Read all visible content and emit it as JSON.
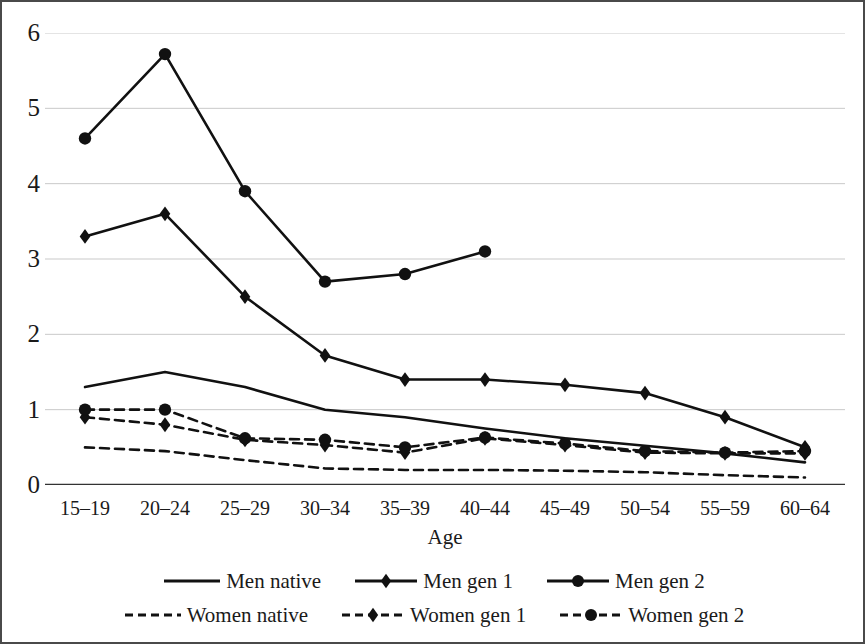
{
  "chart_data": {
    "type": "line",
    "title": "",
    "xlabel": "Age",
    "ylabel": "",
    "categories": [
      "15–19",
      "20–24",
      "25–29",
      "30–34",
      "35–39",
      "40–44",
      "45–49",
      "50–54",
      "55–59",
      "60–64"
    ],
    "ylim": [
      0,
      6
    ],
    "yticks": [
      0,
      1,
      2,
      3,
      4,
      5,
      6
    ],
    "ytick_labels": [
      "0",
      "1",
      "2",
      "3",
      "4",
      "5",
      "6"
    ],
    "grid": "horizontal",
    "legend_position": "bottom",
    "series": [
      {
        "name": "Men native",
        "style": "solid",
        "marker": "none",
        "color": "#111111",
        "values": [
          1.3,
          1.5,
          1.3,
          1.0,
          0.9,
          0.75,
          0.62,
          0.52,
          0.42,
          0.3
        ]
      },
      {
        "name": "Men gen 1",
        "style": "solid",
        "marker": "diamond",
        "color": "#111111",
        "values": [
          3.3,
          3.6,
          2.5,
          1.72,
          1.4,
          1.4,
          1.33,
          1.22,
          0.9,
          0.5
        ]
      },
      {
        "name": "Men gen 2",
        "style": "solid",
        "marker": "circle",
        "color": "#111111",
        "values": [
          4.6,
          5.72,
          3.9,
          2.7,
          2.8,
          3.1,
          null,
          null,
          null,
          null
        ]
      },
      {
        "name": "Women native",
        "style": "dashed",
        "marker": "none",
        "color": "#111111",
        "values": [
          0.5,
          0.45,
          0.33,
          0.22,
          0.2,
          0.2,
          0.19,
          0.17,
          0.13,
          0.1
        ]
      },
      {
        "name": "Women gen 1",
        "style": "dashed",
        "marker": "diamond",
        "color": "#111111",
        "values": [
          0.9,
          0.8,
          0.6,
          0.53,
          0.43,
          0.62,
          0.53,
          0.43,
          0.42,
          0.42
        ]
      },
      {
        "name": "Women gen 2",
        "style": "dashed",
        "marker": "circle",
        "color": "#111111",
        "values": [
          1.0,
          1.0,
          0.62,
          0.6,
          0.5,
          0.63,
          0.55,
          0.45,
          0.43,
          0.45
        ]
      }
    ]
  },
  "legend": {
    "rows": [
      [
        "Men native",
        "Men gen 1",
        "Men gen 2"
      ],
      [
        "Women native",
        "Women gen 1",
        "Women gen 2"
      ]
    ]
  },
  "colors": {
    "line": "#111111",
    "grid": "#c9c9c9",
    "axis": "#333333",
    "border": "#4a4a4a",
    "background": "#ffffff"
  }
}
